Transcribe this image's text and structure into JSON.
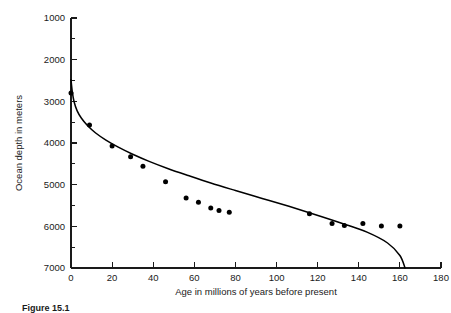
{
  "figure": {
    "caption": "Figure 15.1"
  },
  "chart_data": {
    "type": "scatter",
    "title": "",
    "xlabel": "Age in millions of years before present",
    "ylabel": "Ocean depth in meters",
    "xlim": [
      0,
      180
    ],
    "ylim": [
      1000,
      7000
    ],
    "y_axis_inverted": true,
    "grid": false,
    "legend": "none",
    "xticks": [
      0,
      20,
      40,
      60,
      80,
      100,
      120,
      140,
      160,
      180
    ],
    "xtick_labels": [
      "0",
      "20",
      "40",
      "60",
      "80",
      "100",
      "120",
      "140",
      "160",
      "180"
    ],
    "yticks": [
      1000,
      2000,
      3000,
      4000,
      5000,
      6000,
      7000
    ],
    "ytick_labels": [
      "1000",
      "2000",
      "3000",
      "4000",
      "5000",
      "6000",
      "7000"
    ],
    "x_minor_tick_interval": 10,
    "y_minor_tick_interval": 500,
    "series": [
      {
        "name": "Observed ocean depth",
        "type": "scatter",
        "marker": "filled-circle",
        "color": "#000000",
        "points": [
          {
            "x": 0,
            "y": 2800
          },
          {
            "x": 9,
            "y": 3570
          },
          {
            "x": 20,
            "y": 4070
          },
          {
            "x": 29,
            "y": 4330
          },
          {
            "x": 35,
            "y": 4560
          },
          {
            "x": 46,
            "y": 4930
          },
          {
            "x": 56,
            "y": 5320
          },
          {
            "x": 62,
            "y": 5420
          },
          {
            "x": 68,
            "y": 5560
          },
          {
            "x": 72,
            "y": 5620
          },
          {
            "x": 77,
            "y": 5660
          },
          {
            "x": 116,
            "y": 5700
          },
          {
            "x": 127,
            "y": 5930
          },
          {
            "x": 133,
            "y": 5980
          },
          {
            "x": 142,
            "y": 5930
          },
          {
            "x": 151,
            "y": 5990
          },
          {
            "x": 160,
            "y": 5990
          }
        ]
      },
      {
        "name": "Theoretical subsidence curve",
        "type": "line",
        "color": "#000000",
        "points": [
          {
            "x": 0.0,
            "y": 2480
          },
          {
            "x": 0.6,
            "y": 2760
          },
          {
            "x": 1.5,
            "y": 3010
          },
          {
            "x": 3.0,
            "y": 3230
          },
          {
            "x": 5.0,
            "y": 3400
          },
          {
            "x": 8.0,
            "y": 3580
          },
          {
            "x": 12.0,
            "y": 3760
          },
          {
            "x": 17.0,
            "y": 3930
          },
          {
            "x": 23.0,
            "y": 4100
          },
          {
            "x": 30.0,
            "y": 4270
          },
          {
            "x": 38.0,
            "y": 4440
          },
          {
            "x": 47.0,
            "y": 4610
          },
          {
            "x": 57.0,
            "y": 4780
          },
          {
            "x": 68.0,
            "y": 4960
          },
          {
            "x": 80.0,
            "y": 5140
          },
          {
            "x": 93.0,
            "y": 5330
          },
          {
            "x": 106.0,
            "y": 5520
          },
          {
            "x": 119.0,
            "y": 5720
          },
          {
            "x": 132.0,
            "y": 5930
          },
          {
            "x": 144.0,
            "y": 6140
          },
          {
            "x": 154.0,
            "y": 6400
          },
          {
            "x": 160.0,
            "y": 6700
          },
          {
            "x": 162.5,
            "y": 7000
          }
        ]
      }
    ]
  }
}
